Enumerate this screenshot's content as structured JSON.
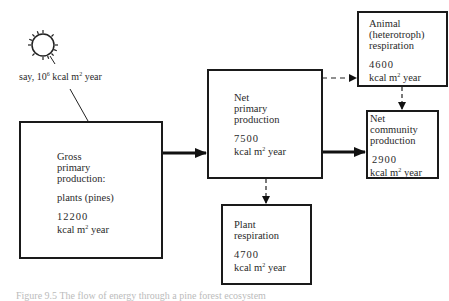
{
  "sun": {
    "icon": "sun-icon",
    "label_prefix": "say, 10",
    "label_exp": "6",
    "label_suffix": " kcal m",
    "label_unit_exp": "2",
    "label_end": " year"
  },
  "boxes": {
    "gross": {
      "title_lines": [
        "Gross",
        "primary",
        "production:"
      ],
      "subtitle": "plants (pines)",
      "value": "12200",
      "unit_prefix": "kcal m",
      "unit_exp": "2",
      "unit_suffix": " year"
    },
    "net_primary": {
      "title_lines": [
        "Net",
        "primary",
        "production"
      ],
      "value": "7500",
      "unit_prefix": "kcal m",
      "unit_exp": "2",
      "unit_suffix": " year"
    },
    "animal": {
      "title_lines": [
        "Animal",
        "(heterotroph)",
        "respiration"
      ],
      "value": "4600",
      "unit_prefix": "kcal m",
      "unit_exp": "2",
      "unit_suffix": " year"
    },
    "net_community": {
      "title_lines": [
        "Net",
        "community",
        "production"
      ],
      "value": "2900",
      "unit_prefix": "kcal m",
      "unit_exp": "2",
      "unit_suffix": " year"
    },
    "plant_resp": {
      "title_lines": [
        "Plant",
        "respiration"
      ],
      "value": "4700",
      "unit_prefix": "kcal m",
      "unit_exp": "2",
      "unit_suffix": " year"
    }
  },
  "arrows": [
    {
      "from": "sun",
      "to": "gross",
      "style": "line"
    },
    {
      "from": "gross",
      "to": "net_primary",
      "style": "solid-thick"
    },
    {
      "from": "net_primary",
      "to": "animal",
      "style": "dashed"
    },
    {
      "from": "net_primary",
      "to": "plant_resp",
      "style": "dashed"
    },
    {
      "from": "net_primary",
      "to": "net_community",
      "style": "solid-thick"
    },
    {
      "from": "animal",
      "to": "net_community",
      "style": "dashed"
    }
  ],
  "caption": "Figure 9.5   The flow of energy through a pine forest ecosystem"
}
